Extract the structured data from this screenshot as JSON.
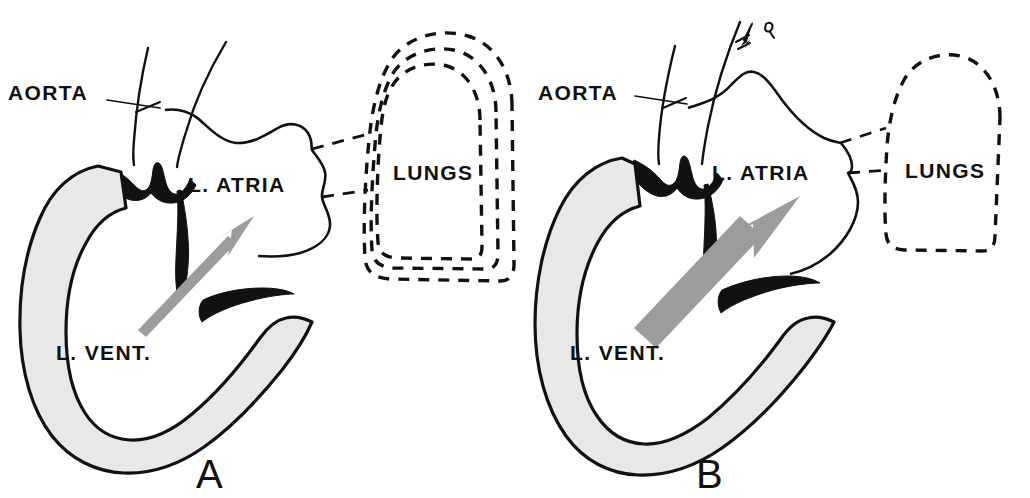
{
  "figure": {
    "background_color": "#ffffff",
    "ink_color": "#111111",
    "wall_fill_color": "#e8e8e8",
    "arrow_color_a": "#9c9c9c",
    "arrow_color_b": "#9c9c9c"
  },
  "panels": [
    {
      "letter": "A",
      "labels": {
        "aorta": "AORTA",
        "atria": "L. ATRIA",
        "ventricle": "L. VENT.",
        "lungs": "LUNGS"
      },
      "lung_contours": 3,
      "flow_arrow": {
        "name": "blood-flow-arrow",
        "weight": "thin",
        "color": "#9c9c9c",
        "direction": "up-right"
      },
      "aortic_outflow_arrow": false
    },
    {
      "letter": "B",
      "labels": {
        "aorta": "AORTA",
        "atria": "L. ATRIA",
        "ventricle": "L. VENT.",
        "lungs": "LUNGS"
      },
      "lung_contours": 1,
      "flow_arrow": {
        "name": "blood-flow-arrow",
        "weight": "thick",
        "color": "#9c9c9c",
        "direction": "up-right"
      },
      "aortic_outflow_arrow": true
    }
  ]
}
